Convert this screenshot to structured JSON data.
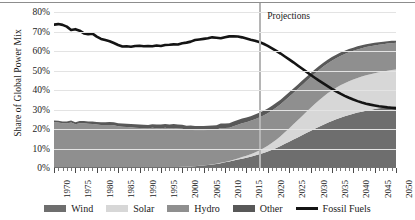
{
  "chart_data": {
    "type": "area",
    "title": "",
    "xlabel": "",
    "ylabel": "Share of Global Power Mix",
    "xlim": [
      1970,
      2050
    ],
    "ylim": [
      0,
      0.8
    ],
    "grid": true,
    "legend_position": "bottom",
    "stacked": true,
    "annotations": [
      {
        "text": "Projections",
        "x": 2018,
        "type": "vertical-divider-label"
      }
    ],
    "ytick_labels": [
      "0%",
      "10%",
      "20%",
      "30%",
      "40%",
      "50%",
      "60%",
      "70%",
      "80%"
    ],
    "ytick_values": [
      0,
      10,
      20,
      30,
      40,
      50,
      60,
      70,
      80
    ],
    "xtick_labels": [
      "1970",
      "1975",
      "1980",
      "1985",
      "1990",
      "1995",
      "2000",
      "2005",
      "2010",
      "2015",
      "2020",
      "2025",
      "2030",
      "2035",
      "2040",
      "2045",
      "2050"
    ],
    "xtick_values": [
      1970,
      1975,
      1980,
      1985,
      1990,
      1995,
      2000,
      2005,
      2010,
      2015,
      2020,
      2025,
      2030,
      2035,
      2040,
      2045,
      2050
    ],
    "x": [
      1970,
      1971,
      1972,
      1973,
      1974,
      1975,
      1976,
      1977,
      1978,
      1979,
      1980,
      1981,
      1982,
      1983,
      1984,
      1985,
      1986,
      1987,
      1988,
      1989,
      1990,
      1991,
      1992,
      1993,
      1994,
      1995,
      1996,
      1997,
      1998,
      1999,
      2000,
      2001,
      2002,
      2003,
      2004,
      2005,
      2006,
      2007,
      2008,
      2009,
      2010,
      2011,
      2012,
      2013,
      2014,
      2015,
      2016,
      2017,
      2018,
      2019,
      2020,
      2021,
      2022,
      2023,
      2024,
      2025,
      2026,
      2027,
      2028,
      2029,
      2030,
      2031,
      2032,
      2033,
      2034,
      2035,
      2036,
      2037,
      2038,
      2039,
      2040,
      2041,
      2042,
      2043,
      2044,
      2045,
      2046,
      2047,
      2048,
      2049,
      2050
    ],
    "series": [
      {
        "name": "Wind",
        "color": "#6e6e6e",
        "values": [
          0,
          0,
          0,
          0,
          0,
          0,
          0,
          0,
          0,
          0,
          0,
          0,
          0,
          0,
          0,
          0,
          0,
          0,
          0,
          0,
          0.1,
          0.1,
          0.1,
          0.2,
          0.2,
          0.2,
          0.3,
          0.3,
          0.4,
          0.5,
          0.6,
          0.7,
          0.8,
          0.9,
          1.1,
          1.3,
          1.5,
          1.8,
          2.1,
          2.5,
          2.9,
          3.3,
          3.8,
          4.3,
          4.8,
          5.3,
          5.8,
          6.4,
          7.0,
          7.7,
          8.5,
          9.4,
          10.3,
          11.3,
          12.4,
          13.5,
          14.6,
          15.7,
          16.8,
          17.9,
          19.0,
          20.1,
          21.2,
          22.2,
          23.2,
          24.1,
          25.0,
          25.8,
          26.5,
          27.2,
          27.8,
          28.4,
          28.9,
          29.4,
          29.8,
          30.2,
          30.6,
          30.9,
          31.2,
          31.4,
          31.6
        ]
      },
      {
        "name": "Solar",
        "color": "#d7d7d7",
        "values": [
          0,
          0,
          0,
          0,
          0,
          0,
          0,
          0,
          0,
          0,
          0,
          0,
          0,
          0,
          0,
          0,
          0,
          0,
          0,
          0,
          0,
          0,
          0,
          0,
          0,
          0,
          0,
          0,
          0,
          0,
          0,
          0,
          0,
          0,
          0,
          0,
          0.1,
          0.1,
          0.1,
          0.2,
          0.2,
          0.3,
          0.4,
          0.6,
          0.8,
          1.0,
          1.3,
          1.6,
          2.0,
          2.4,
          2.9,
          3.5,
          4.2,
          5.0,
          5.9,
          6.8,
          7.8,
          8.8,
          9.8,
          10.8,
          11.8,
          12.7,
          13.6,
          14.4,
          15.1,
          15.7,
          16.2,
          16.6,
          17.0,
          17.3,
          17.6,
          17.8,
          18.0,
          18.2,
          18.3,
          18.4,
          18.5,
          18.6,
          18.7,
          18.8,
          18.9
        ]
      },
      {
        "name": "Hydro",
        "color": "#8f8f8f",
        "values": [
          23.5,
          23.3,
          23.0,
          22.8,
          23.3,
          22.4,
          23.0,
          22.9,
          22.7,
          22.6,
          22.3,
          22.1,
          22.0,
          22.1,
          21.9,
          21.4,
          21.2,
          21.0,
          20.9,
          20.6,
          20.4,
          20.3,
          20.1,
          20.4,
          20.2,
          20.1,
          20.3,
          20.0,
          20.1,
          19.7,
          19.5,
          18.9,
          18.8,
          18.5,
          18.3,
          18.0,
          17.9,
          17.6,
          17.4,
          17.8,
          17.4,
          17.1,
          17.2,
          17.3,
          17.4,
          17.2,
          17.1,
          17.0,
          16.9,
          16.8,
          16.7,
          16.6,
          16.5,
          16.4,
          16.3,
          16.2,
          16.1,
          16.0,
          15.9,
          15.8,
          15.7,
          15.6,
          15.5,
          15.4,
          15.3,
          15.2,
          15.1,
          15.0,
          14.9,
          14.8,
          14.7,
          14.6,
          14.5,
          14.4,
          14.3,
          14.2,
          14.1,
          14.0,
          13.9,
          13.8,
          13.7
        ]
      },
      {
        "name": "Other",
        "color": "#585858",
        "values": [
          0.8,
          0.9,
          0.9,
          1.0,
          1.0,
          1.1,
          1.1,
          1.2,
          1.2,
          1.3,
          1.3,
          1.4,
          1.4,
          1.5,
          1.5,
          1.6,
          1.6,
          1.7,
          1.7,
          1.8,
          1.8,
          1.8,
          1.9,
          1.9,
          1.9,
          2.0,
          2.0,
          2.0,
          2.1,
          2.1,
          2.1,
          2.1,
          2.2,
          2.2,
          2.2,
          2.2,
          2.2,
          2.3,
          2.3,
          2.3,
          2.3,
          2.3,
          2.4,
          2.4,
          2.4,
          2.4,
          2.4,
          2.4,
          2.4,
          2.4,
          2.4,
          2.4,
          2.4,
          2.3,
          2.3,
          2.3,
          2.3,
          2.2,
          2.2,
          2.2,
          2.1,
          2.1,
          2.0,
          2.0,
          1.9,
          1.9,
          1.8,
          1.8,
          1.7,
          1.7,
          1.6,
          1.6,
          1.5,
          1.5,
          1.4,
          1.4,
          1.3,
          1.3,
          1.2,
          1.2,
          1.1
        ]
      }
    ],
    "line_series": [
      {
        "name": "Fossil Fuels",
        "color": "#141414",
        "values": [
          73.5,
          73.8,
          73.4,
          72.5,
          70.8,
          71.2,
          70.4,
          69.0,
          68.6,
          68.9,
          67.4,
          66.2,
          65.6,
          65.0,
          64.1,
          63.1,
          62.3,
          62.4,
          62.2,
          62.6,
          62.7,
          62.4,
          62.5,
          62.4,
          62.8,
          62.6,
          63.1,
          63.2,
          63.4,
          63.3,
          64.0,
          64.3,
          64.8,
          65.6,
          65.9,
          66.2,
          66.5,
          67.0,
          66.8,
          66.5,
          67.1,
          67.5,
          67.6,
          67.4,
          67.0,
          66.4,
          65.8,
          65.3,
          64.6,
          63.7,
          62.6,
          61.4,
          60.1,
          58.7,
          57.2,
          55.7,
          54.2,
          52.6,
          51.0,
          49.4,
          47.8,
          46.3,
          44.8,
          43.4,
          42.0,
          40.6,
          39.3,
          38.1,
          37.0,
          36.0,
          35.1,
          34.3,
          33.6,
          33.0,
          32.5,
          32.1,
          31.7,
          31.4,
          31.1,
          30.9,
          30.7
        ]
      }
    ]
  },
  "legend": {
    "items": [
      {
        "label": "Wind",
        "color": "#6e6e6e",
        "marker": "swatch"
      },
      {
        "label": "Solar",
        "color": "#d7d7d7",
        "marker": "swatch"
      },
      {
        "label": "Hydro",
        "color": "#8f8f8f",
        "marker": "swatch"
      },
      {
        "label": "Other",
        "color": "#585858",
        "marker": "swatch"
      },
      {
        "label": "Fossil Fuels",
        "color": "#141414",
        "marker": "line"
      }
    ]
  }
}
